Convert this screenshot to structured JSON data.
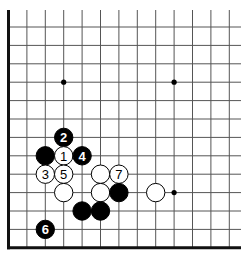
{
  "diagram": {
    "type": "go-board-partial",
    "visible_columns": 13,
    "visible_rows": 13,
    "edges_shown": [
      "left",
      "bottom"
    ],
    "colors": {
      "black_stone": "#000000",
      "white_stone": "#ffffff",
      "grid": "#555555",
      "edge": "#111111"
    },
    "star_points": [
      {
        "col": 3,
        "row": 3
      },
      {
        "col": 9,
        "row": 3
      },
      {
        "col": 9,
        "row": 9
      }
    ],
    "stones": [
      {
        "color": "black",
        "col": 3,
        "row": 6,
        "label": "2"
      },
      {
        "color": "black",
        "col": 2,
        "row": 7,
        "label": ""
      },
      {
        "color": "white",
        "col": 3,
        "row": 7,
        "label": "1"
      },
      {
        "color": "black",
        "col": 4,
        "row": 7,
        "label": "4"
      },
      {
        "color": "white",
        "col": 2,
        "row": 8,
        "label": "3"
      },
      {
        "color": "white",
        "col": 3,
        "row": 8,
        "label": "5"
      },
      {
        "color": "white",
        "col": 5,
        "row": 8,
        "label": ""
      },
      {
        "color": "white",
        "col": 6,
        "row": 8,
        "label": "7"
      },
      {
        "color": "white",
        "col": 3,
        "row": 9,
        "label": ""
      },
      {
        "color": "white",
        "col": 5,
        "row": 9,
        "label": ""
      },
      {
        "color": "black",
        "col": 6,
        "row": 9,
        "label": ""
      },
      {
        "color": "white",
        "col": 8,
        "row": 9,
        "label": ""
      },
      {
        "color": "black",
        "col": 4,
        "row": 10,
        "label": ""
      },
      {
        "color": "black",
        "col": 5,
        "row": 10,
        "label": ""
      },
      {
        "color": "black",
        "col": 2,
        "row": 11,
        "label": "6"
      }
    ]
  }
}
